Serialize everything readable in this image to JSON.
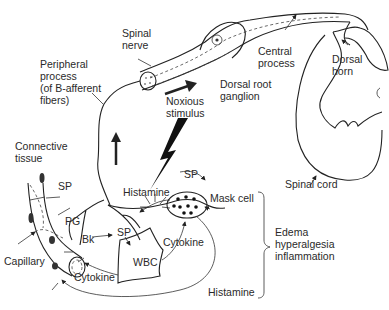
{
  "diagram": {
    "labels": {
      "spinal_nerve": "Spinal\nnerve",
      "peripheral_process": "Peripheral\nprocess\n(of B-afferent\nfibers)",
      "central_process": "Central\nprocess",
      "dorsal_horn": "Dorsal\nhorn",
      "dorsal_root_ganglion": "Dorsal root\nganglion",
      "noxious_stimulus": "Noxious\nstimulus",
      "connective_tissue": "Connective\ntissue",
      "spinal_cord": "Spinal cord",
      "sp_left": "SP",
      "sp_top_right": "SP",
      "sp_center": "SP",
      "histamine_top": "Histamine",
      "mask_cell": "Mask cell",
      "pg": "PG",
      "bk": "Bk",
      "cytokine_right": "Cytokine",
      "cytokine_bottom": "Cytokine",
      "wbc": "WBC",
      "capillary": "Capillary",
      "histamine_bottom": "Histamine",
      "effects": "Edema\nhyperalgesia\ninflammation"
    },
    "colors": {
      "line": "#222222",
      "text": "#2a2a2a",
      "background": "#ffffff"
    }
  }
}
